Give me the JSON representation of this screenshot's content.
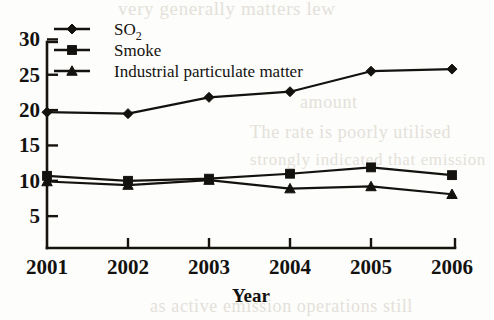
{
  "chart_data": {
    "type": "line",
    "title": "",
    "xlabel": "Year",
    "ylabel": "",
    "categories": [
      "2001",
      "2002",
      "2003",
      "2004",
      "2005",
      "2006"
    ],
    "x": [
      2001,
      2002,
      2003,
      2004,
      2005,
      2006
    ],
    "xlim": [
      2001,
      2006
    ],
    "ylim": [
      0,
      30
    ],
    "yticks": [
      5,
      10,
      15,
      20,
      25,
      30
    ],
    "ytick_labels": [
      "5",
      "10",
      "15",
      "20",
      "25",
      "30"
    ],
    "xticks": [
      2001,
      2002,
      2003,
      2004,
      2005,
      2006
    ],
    "xtick_labels": [
      "2001",
      "2002",
      "2003",
      "2004",
      "2005",
      "2006"
    ],
    "grid": false,
    "legend_position": "top-left-inside",
    "series": [
      {
        "name": "SO2",
        "label_main": "SO",
        "label_sub": "2",
        "marker": "diamond",
        "color": "#14120f",
        "values": [
          19.7,
          19.5,
          21.8,
          22.6,
          25.5,
          25.8
        ]
      },
      {
        "name": "Smoke",
        "label_main": "Smoke",
        "label_sub": "",
        "marker": "square",
        "color": "#14120f",
        "values": [
          10.7,
          10.0,
          10.3,
          11.0,
          11.9,
          10.8
        ]
      },
      {
        "name": "Industrial particulate matter",
        "label_main": "Industrial particulate matter",
        "label_sub": "",
        "marker": "triangle",
        "color": "#14120f",
        "values": [
          9.9,
          9.4,
          10.1,
          8.9,
          9.2,
          8.1
        ]
      }
    ]
  },
  "axis": {
    "x_title": "Year"
  },
  "legend": {
    "entries": [
      {
        "label": "SO2",
        "marker": "diamond"
      },
      {
        "label": "Smoke",
        "marker": "square"
      },
      {
        "label": "Industrial particulate matter",
        "marker": "triangle"
      }
    ]
  },
  "background_text": {
    "top": "very generally matters lew",
    "right_1": "amount",
    "right_2": "The rate is poorly utilised",
    "right_3": "strongly indicated that emission",
    "bottom": "as active emission operations still"
  }
}
